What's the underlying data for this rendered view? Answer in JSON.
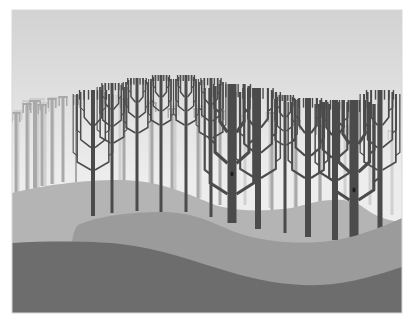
{
  "scene": {
    "title": "Stylized grayscale forest on rolling hills",
    "frame": {
      "x": 12,
      "y": 10,
      "w": 390,
      "h": 303
    },
    "colors": {
      "sky_top": "#d2d2d2",
      "sky_bottom": "#ededed",
      "far_trees": "#cdcdcd",
      "mid_trees": "#a9a9a9",
      "front_trees": "#4b4b4b",
      "back_hill": "#b4b4b4",
      "mid_hill": "#9b9b9b",
      "front_hill": "#6d6d6d",
      "frame_border": "#d8d8d8"
    },
    "far_trees": [
      {
        "x": 18,
        "top": 110,
        "bottom": 195,
        "w": 3
      },
      {
        "x": 28,
        "top": 100,
        "bottom": 192,
        "w": 4
      },
      {
        "x": 37,
        "top": 98,
        "bottom": 188,
        "w": 5
      },
      {
        "x": 45,
        "top": 102,
        "bottom": 186,
        "w": 3
      },
      {
        "x": 53,
        "top": 97,
        "bottom": 184,
        "w": 3
      },
      {
        "x": 120,
        "top": 95,
        "bottom": 182,
        "w": 3
      },
      {
        "x": 150,
        "top": 100,
        "bottom": 186,
        "w": 3
      },
      {
        "x": 175,
        "top": 105,
        "bottom": 190,
        "w": 3
      },
      {
        "x": 200,
        "top": 105,
        "bottom": 198,
        "w": 3
      },
      {
        "x": 245,
        "top": 115,
        "bottom": 205,
        "w": 3
      },
      {
        "x": 270,
        "top": 112,
        "bottom": 208,
        "w": 3
      },
      {
        "x": 295,
        "top": 118,
        "bottom": 208,
        "w": 3
      },
      {
        "x": 320,
        "top": 120,
        "bottom": 205,
        "w": 3
      },
      {
        "x": 345,
        "top": 125,
        "bottom": 200,
        "w": 3
      },
      {
        "x": 370,
        "top": 125,
        "bottom": 205,
        "w": 3
      },
      {
        "x": 392,
        "top": 130,
        "bottom": 215,
        "w": 3
      }
    ],
    "mid_trees": [
      {
        "x": 16,
        "top": 112,
        "bottom": 193,
        "w": 3
      },
      {
        "x": 27,
        "top": 103,
        "bottom": 190,
        "w": 3
      },
      {
        "x": 35,
        "top": 100,
        "bottom": 188,
        "w": 4
      },
      {
        "x": 42,
        "top": 104,
        "bottom": 186,
        "w": 3
      },
      {
        "x": 52,
        "top": 98,
        "bottom": 184,
        "w": 3
      },
      {
        "x": 63,
        "top": 96,
        "bottom": 182,
        "w": 3
      },
      {
        "x": 76,
        "top": 95,
        "bottom": 182,
        "w": 2
      },
      {
        "x": 124,
        "top": 98,
        "bottom": 182,
        "w": 3
      },
      {
        "x": 152,
        "top": 102,
        "bottom": 188,
        "w": 3
      },
      {
        "x": 172,
        "top": 108,
        "bottom": 191,
        "w": 3
      },
      {
        "x": 198,
        "top": 108,
        "bottom": 200,
        "w": 3
      },
      {
        "x": 220,
        "top": 110,
        "bottom": 205,
        "w": 3
      },
      {
        "x": 272,
        "top": 112,
        "bottom": 210,
        "w": 3
      },
      {
        "x": 296,
        "top": 120,
        "bottom": 210,
        "w": 3
      },
      {
        "x": 320,
        "top": 125,
        "bottom": 208,
        "w": 3
      }
    ],
    "front_trees": [
      {
        "x": 93,
        "top": 90,
        "bottom": 216,
        "w": 4,
        "crown": 16,
        "knot": null
      },
      {
        "x": 112,
        "top": 83,
        "bottom": 213,
        "w": 3,
        "crown": 12,
        "knot": null
      },
      {
        "x": 137,
        "top": 78,
        "bottom": 211,
        "w": 3,
        "crown": 11,
        "knot": null
      },
      {
        "x": 161,
        "top": 75,
        "bottom": 212,
        "w": 3,
        "crown": 10,
        "knot": null
      },
      {
        "x": 186,
        "top": 75,
        "bottom": 212,
        "w": 3,
        "crown": 10,
        "knot": null
      },
      {
        "x": 211,
        "top": 78,
        "bottom": 217,
        "w": 3,
        "crown": 12,
        "knot": null
      },
      {
        "x": 232,
        "top": 84,
        "bottom": 223,
        "w": 9,
        "crown": 22,
        "knot": 174
      },
      {
        "x": 258,
        "top": 88,
        "bottom": 229,
        "w": 6,
        "crown": 18,
        "knot": null
      },
      {
        "x": 285,
        "top": 95,
        "bottom": 233,
        "w": 3,
        "crown": 10,
        "knot": null
      },
      {
        "x": 308,
        "top": 98,
        "bottom": 237,
        "w": 6,
        "crown": 16,
        "knot": null
      },
      {
        "x": 335,
        "top": 100,
        "bottom": 240,
        "w": 6,
        "crown": 16,
        "knot": null
      },
      {
        "x": 354,
        "top": 100,
        "bottom": 239,
        "w": 9,
        "crown": 20,
        "knot": 190
      },
      {
        "x": 380,
        "top": 90,
        "bottom": 229,
        "w": 5,
        "crown": 16,
        "knot": null
      }
    ],
    "hills": {
      "back": "M12,193 C40,186 80,180 120,180 C160,180 190,195 215,205 C245,214 285,210 300,206 C320,200 345,196 360,205 C370,212 380,220 402,222 L402,313 L12,313 Z",
      "mid": "M72,243 C73,234 75,226 80,224 C100,216 130,212 160,212 C195,212 210,222 235,232 C260,241 290,244 320,242 C350,240 380,228 402,218 L402,313 L72,313 Z",
      "front": "M12,243 C50,241 90,241 120,244 C160,248 195,262 230,272 C260,281 290,286 320,285 C350,284 380,274 402,267 L402,313 L12,313 Z"
    }
  }
}
